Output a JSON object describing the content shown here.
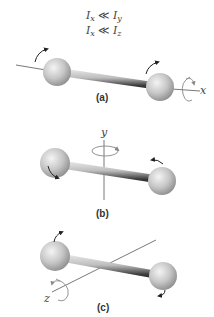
{
  "equations": {
    "line1": {
      "lhs": "I",
      "lhs_sub": "x",
      "op": "≪",
      "rhs": "I",
      "rhs_sub": "y"
    },
    "line2": {
      "lhs": "I",
      "lhs_sub": "x",
      "op": "≪",
      "rhs": "I",
      "rhs_sub": "z"
    }
  },
  "panels": [
    {
      "label": "(a)",
      "axis": "x",
      "description": "rotation about x-axis (along molecular bond)"
    },
    {
      "label": "(b)",
      "axis": "y",
      "description": "rotation about y-axis (perpendicular to bond)"
    },
    {
      "label": "(c)",
      "axis": "z",
      "description": "rotation about z-axis (perpendicular to bond)"
    }
  ],
  "colors": {
    "sphere_light": "#f2f2f2",
    "sphere_mid": "#c4c4c4",
    "sphere_dark": "#8a8a8a",
    "rod_light": "#e6e6e6",
    "rod_dark": "#333333",
    "axis_line": "#555555",
    "arrow": "#222222",
    "circular_arrow": "#888888"
  }
}
